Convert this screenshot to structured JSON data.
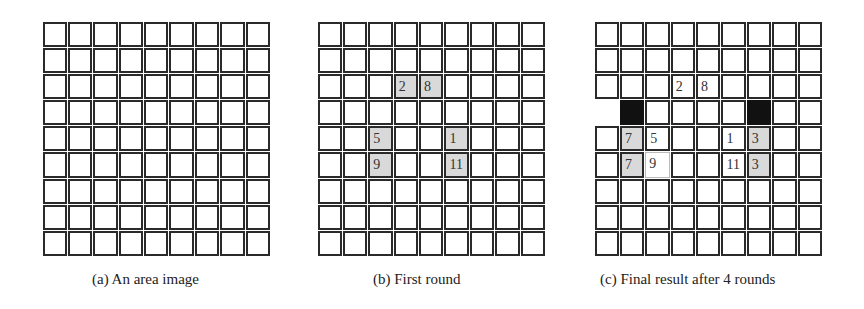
{
  "panels": [
    {
      "id": "a",
      "caption": "(a)  An area image",
      "rows": 9,
      "cols": 9,
      "cells": []
    },
    {
      "id": "b",
      "caption": "(b)  First round",
      "rows": 9,
      "cols": 9,
      "cells": [
        {
          "r": 2,
          "c": 3,
          "label": "2",
          "style": "gray"
        },
        {
          "r": 2,
          "c": 4,
          "label": "8",
          "style": "gray"
        },
        {
          "r": 4,
          "c": 2,
          "label": "5",
          "style": "gray"
        },
        {
          "r": 4,
          "c": 5,
          "label": "1",
          "style": "gray"
        },
        {
          "r": 5,
          "c": 2,
          "label": "9",
          "style": "gray"
        },
        {
          "r": 5,
          "c": 5,
          "label": "11",
          "style": "gray"
        }
      ]
    },
    {
      "id": "c",
      "caption": "(c)  Final result after 4 rounds",
      "rows": 9,
      "cols": 9,
      "cells": [
        {
          "r": 2,
          "c": 3,
          "label": "2",
          "style": "white"
        },
        {
          "r": 2,
          "c": 4,
          "label": "8",
          "style": "white"
        },
        {
          "r": 3,
          "c": 0,
          "label": "",
          "style": "open"
        },
        {
          "r": 3,
          "c": 1,
          "label": "",
          "style": "black"
        },
        {
          "r": 3,
          "c": 6,
          "label": "",
          "style": "black"
        },
        {
          "r": 4,
          "c": 1,
          "label": "7",
          "style": "gray"
        },
        {
          "r": 4,
          "c": 2,
          "label": "5",
          "style": "white"
        },
        {
          "r": 4,
          "c": 5,
          "label": "1",
          "style": "white"
        },
        {
          "r": 4,
          "c": 6,
          "label": "3",
          "style": "gray"
        },
        {
          "r": 5,
          "c": 1,
          "label": "7",
          "style": "gray"
        },
        {
          "r": 5,
          "c": 2,
          "label": "9",
          "style": "thin"
        },
        {
          "r": 5,
          "c": 5,
          "label": "11",
          "style": "white"
        },
        {
          "r": 5,
          "c": 6,
          "label": "3",
          "style": "gray"
        }
      ]
    }
  ],
  "colors": {
    "grid_line": "#2a2a2a",
    "shaded": "#d9d9d9",
    "blocked": "#111111",
    "background": "#ffffff"
  }
}
